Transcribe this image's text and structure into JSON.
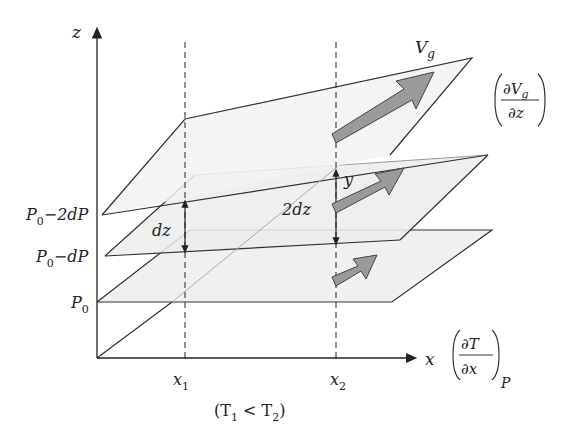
{
  "diagram": {
    "axes": {
      "z_label": "z",
      "x_label": "x",
      "x1_label": "x",
      "x1_sub": "1",
      "x2_label": "x",
      "x2_sub": "2",
      "y_label": "y"
    },
    "planes": [
      {
        "label_main": "P",
        "label_sub": "0",
        "label_tail": "−2dP"
      },
      {
        "label_main": "P",
        "label_sub": "0",
        "label_tail": "−dP"
      },
      {
        "label_main": "P",
        "label_sub": "0",
        "label_tail": ""
      }
    ],
    "spacing": {
      "dz_label": "dz",
      "two_dz_label": "2dz"
    },
    "vg": {
      "label_main": "V",
      "label_sub": "g"
    },
    "shear_fraction": {
      "numerator_main": "∂V",
      "numerator_sub": "g",
      "denominator": "∂z"
    },
    "temp_gradient_fraction": {
      "numerator": "∂T",
      "denominator": "∂x",
      "subscript": "P"
    },
    "caption": {
      "open": "(T",
      "t1_sub": "1",
      "mid": " < T",
      "t2_sub": "2",
      "close": ")"
    },
    "colors": {
      "line": "#333333",
      "plane_fill": "#eeeeee",
      "arrow_fill": "#9a9a9a",
      "arrow_stroke": "#444444",
      "back_line": "#999999"
    }
  }
}
